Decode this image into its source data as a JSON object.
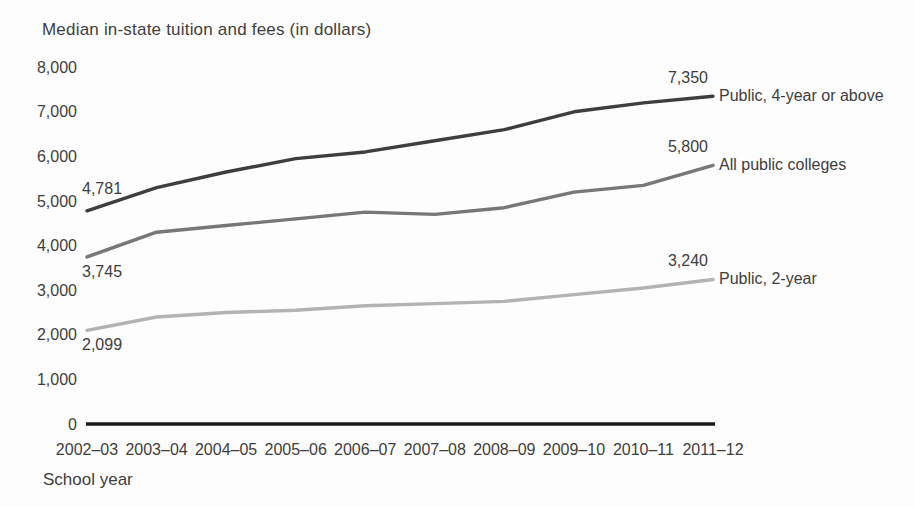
{
  "chart_data": {
    "type": "line",
    "title": "Median in-state tuition and fees (in dollars)",
    "xlabel": "School year",
    "ylabel": "",
    "ylim": [
      0,
      8000
    ],
    "grid": false,
    "legend_position": "labels-at-line-ends",
    "x_categories": [
      "2002–03",
      "2003–04",
      "2004–05",
      "2005–06",
      "2006–07",
      "2007–08",
      "2008–09",
      "2009–10",
      "2010–11",
      "2011–12"
    ],
    "y_tick_values": [
      0,
      1000,
      2000,
      3000,
      4000,
      5000,
      6000,
      7000,
      8000
    ],
    "y_tick_labels": [
      "0",
      "1,000",
      "2,000",
      "3,000",
      "4,000",
      "5,000",
      "6,000",
      "7,000",
      "8,000"
    ],
    "series": [
      {
        "name": "Public, 4-year or above",
        "values": [
          4781,
          5300,
          5650,
          5950,
          6100,
          6350,
          6600,
          7000,
          7200,
          7350
        ],
        "color": "#3e3e3e",
        "start_label": "4,781",
        "start_label_position": "above",
        "end_label": "7,350"
      },
      {
        "name": "All public colleges",
        "values": [
          3745,
          4300,
          4450,
          4600,
          4750,
          4700,
          4850,
          5200,
          5350,
          5800
        ],
        "color": "#777777",
        "start_label": "3,745",
        "start_label_position": "below",
        "end_label": "5,800"
      },
      {
        "name": "Public, 2-year",
        "values": [
          2099,
          2400,
          2500,
          2550,
          2650,
          2700,
          2750,
          2900,
          3050,
          3240
        ],
        "color": "#b3b3b3",
        "start_label": "2,099",
        "start_label_position": "below",
        "end_label": "3,240"
      }
    ],
    "axis_color": "#1c1c1c",
    "text_color": "#3d3d3d"
  }
}
